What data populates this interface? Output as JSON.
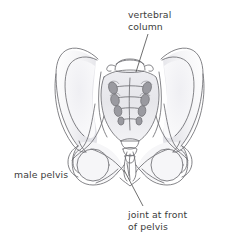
{
  "figure": {
    "view": "anterior",
    "background_color": "#ffffff",
    "outline_color": "#6e6e72",
    "shading_color": "#d9d9dd",
    "foramen_color": "#8d8d92",
    "leader_line_color": "#4a4a4a",
    "text_color": "#3b3b3b"
  },
  "labels": {
    "vertebral_column": {
      "line1": "vertebral",
      "line2": "column"
    },
    "male_pelvis": {
      "line1": "male pelvis"
    },
    "joint_front_pelvis": {
      "line1": "joint at front",
      "line2": "of pelvis"
    }
  },
  "parts": {
    "sacrum": "sacrum",
    "coccyx": "coccyx",
    "lumbar_vertebra": "L5 vertebra",
    "left_ilium": "left ilium",
    "right_ilium": "right ilium",
    "left_obturator_foramen": "left obturator foramen",
    "right_obturator_foramen": "right obturator foramen",
    "pubic_symphysis": "pubic symphysis",
    "sacral_foramina_pairs": "4"
  }
}
